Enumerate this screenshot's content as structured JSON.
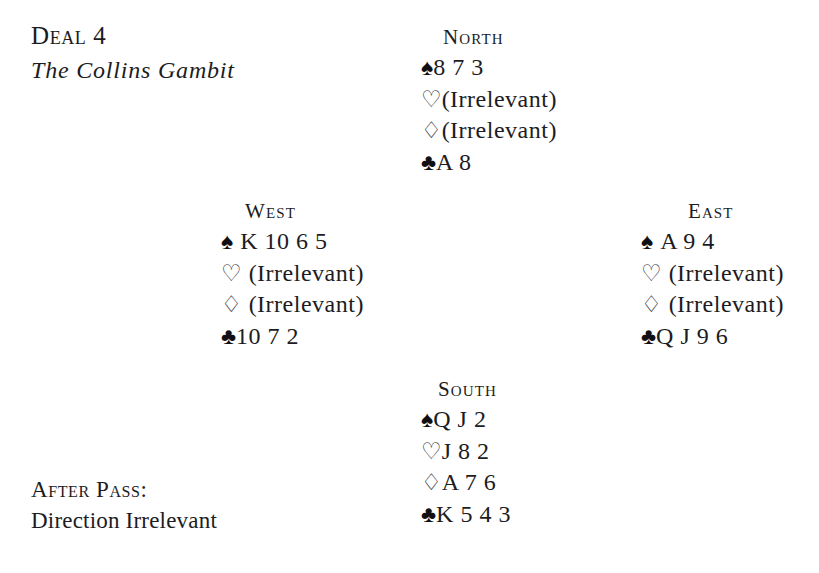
{
  "deal": {
    "number_label": "Deal 4",
    "name": "The Collins Gambit"
  },
  "note": {
    "line1": "After Pass:",
    "line2": "Direction Irrelevant"
  },
  "suit_symbols": {
    "spade": "♠",
    "heart": "♡",
    "diamond": "♢",
    "club": "♣"
  },
  "colors": {
    "text": "#1c1c22",
    "background": "#ffffff",
    "black_suit": "#101014",
    "hollow_suit": "#33333a"
  },
  "hands": {
    "north": {
      "label": "North",
      "spades": "8 7 3",
      "hearts": "(Irrelevant)",
      "diamonds": "(Irrelevant)",
      "clubs": "A 8"
    },
    "west": {
      "label": "West",
      "spades": "K 10 6 5",
      "hearts": "(Irrelevant)",
      "diamonds": "(Irrelevant)",
      "clubs": "10 7 2"
    },
    "east": {
      "label": "East",
      "spades": "A 9 4",
      "hearts": "(Irrelevant)",
      "diamonds": "(Irrelevant)",
      "clubs": "Q J 9 6"
    },
    "south": {
      "label": "South",
      "spades": "Q J 2",
      "hearts": "J 8 2",
      "diamonds": "A 7 6",
      "clubs": "K 5 4 3"
    }
  }
}
